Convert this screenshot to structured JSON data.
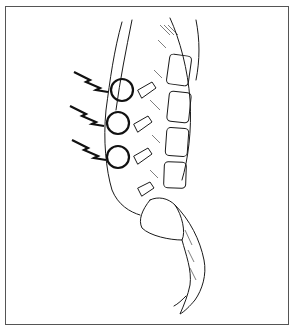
{
  "figure": {
    "style": "black-and-white line illustration",
    "frame_color": "#555555",
    "ink_color": "#1a1a1a",
    "background": "#ffffff",
    "markers": [
      {
        "type": "lightning-bolt-with-circle",
        "target": "upper-facet-joint",
        "circle_cx": 122,
        "circle_cy": 90
      },
      {
        "type": "lightning-bolt-with-circle",
        "target": "middle-facet-joint",
        "circle_cx": 118,
        "circle_cy": 123
      },
      {
        "type": "lightning-bolt-with-circle",
        "target": "lower-facet-joint",
        "circle_cx": 118,
        "circle_cy": 157
      }
    ]
  }
}
